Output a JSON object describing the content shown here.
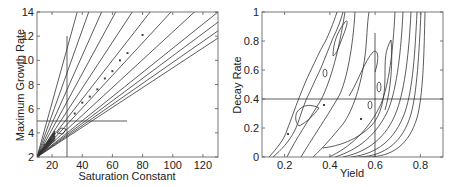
{
  "chart_data": [
    {
      "type": "line",
      "subtype": "contour",
      "title": "",
      "xlabel": "Saturation Constant",
      "ylabel": "Maximum Growth Rate",
      "xlim": [
        10,
        130
      ],
      "ylim": [
        2,
        14
      ],
      "xticks": [
        20,
        40,
        60,
        80,
        100,
        120
      ],
      "yticks": [
        2,
        4,
        6,
        8,
        10,
        12,
        14
      ],
      "grid": false,
      "reference_lines": {
        "vertical_x": 30,
        "vertical_y_range": [
          2,
          12
        ],
        "horizontal_y": 5,
        "horizontal_x_range": [
          10,
          70
        ]
      },
      "contours": "fan of straight lines radiating from approximately (10, 2)",
      "contour_slopes": [
        0.45,
        0.35,
        0.28,
        0.23,
        0.19,
        0.16,
        0.135,
        0.115,
        0.1,
        0.093,
        0.087,
        0.082
      ],
      "points": [
        [
          15,
          3
        ],
        [
          20,
          3.6
        ],
        [
          20,
          3.5
        ],
        [
          35,
          5.6
        ],
        [
          40,
          6.5
        ],
        [
          45,
          7.0
        ],
        [
          50,
          7.6
        ],
        [
          55,
          8.5
        ],
        [
          60,
          9.1
        ],
        [
          65,
          10.0
        ],
        [
          70,
          10.6
        ],
        [
          80,
          12.1
        ]
      ]
    },
    {
      "type": "line",
      "subtype": "contour",
      "title": "",
      "xlabel": "Yield",
      "ylabel": "Decay Rate",
      "xlim": [
        0.1,
        0.9
      ],
      "ylim": [
        0,
        1
      ],
      "xticks": [
        0.2,
        0.4,
        0.6,
        0.8
      ],
      "yticks": [
        0,
        0.2,
        0.4,
        0.6,
        0.8,
        1
      ],
      "grid": false,
      "reference_lines": {
        "vertical_x": 0.6,
        "vertical_y_range": [
          0,
          0.85
        ],
        "horizontal_y": 0.4,
        "horizontal_x_range": [
          0.1,
          0.8
        ]
      },
      "contours": "curved contours rising steeply to the right",
      "points": [
        [
          0.22,
          0.15
        ],
        [
          0.38,
          0.35
        ],
        [
          0.54,
          0.25
        ]
      ]
    }
  ],
  "left": {
    "xlabel": "Saturation Constant",
    "ylabel": "Maximum Growth Rate",
    "xticks": [
      "20",
      "40",
      "60",
      "80",
      "100",
      "120"
    ],
    "yticks": [
      "2",
      "4",
      "6",
      "8",
      "10",
      "12",
      "14"
    ]
  },
  "right": {
    "xlabel": "Yield",
    "ylabel": "Decay Rate",
    "xticks": [
      "0.2",
      "0.4",
      "0.6",
      "0.8"
    ],
    "yticks": [
      "0",
      "0.2",
      "0.4",
      "0.6",
      "0.8",
      "1"
    ]
  },
  "colors": {
    "line": "#333333",
    "axis": "#555555",
    "text": "#222222"
  }
}
